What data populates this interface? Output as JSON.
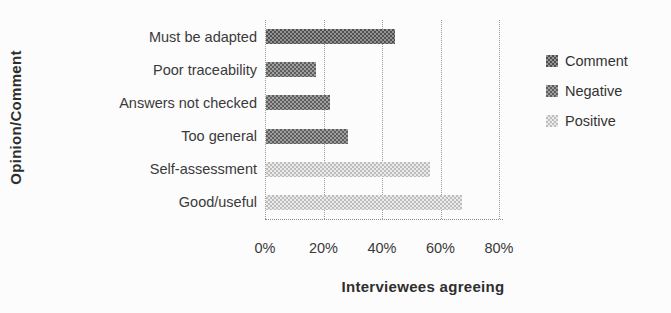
{
  "chart_data": {
    "type": "bar",
    "orientation": "horizontal",
    "title": "",
    "ylabel": "Opinion/Comment",
    "xlabel": "Interviewees agreeing",
    "categories": [
      "Must be adapted",
      "Poor traceability",
      "Answers not checked",
      "Too general",
      "Self-assessment",
      "Good/useful"
    ],
    "values": [
      44,
      17,
      22,
      28,
      56,
      67
    ],
    "series_of_category": [
      "Comment",
      "Negative",
      "Negative",
      "Negative",
      "Positive",
      "Positive"
    ],
    "x_ticks": [
      {
        "label": "0%",
        "value": 0
      },
      {
        "label": "20%",
        "value": 20
      },
      {
        "label": "40%",
        "value": 40
      },
      {
        "label": "60%",
        "value": 60
      },
      {
        "label": "80%",
        "value": 80
      }
    ],
    "xlim": [
      0,
      80
    ],
    "grid": "vertical-dotted",
    "legend_position": "right",
    "legend": [
      {
        "label": "Comment",
        "color": "#4f4f4f",
        "color_light": "#949494"
      },
      {
        "label": "Negative",
        "color": "#5e5e5e",
        "color_light": "#9e9e9e"
      },
      {
        "label": "Positive",
        "color": "#bdbdbd",
        "color_light": "#ebebeb"
      }
    ],
    "colors": {
      "text": "#3a3a3a",
      "gridline": "#9a9a9a",
      "background": "#fcfcfc"
    }
  }
}
